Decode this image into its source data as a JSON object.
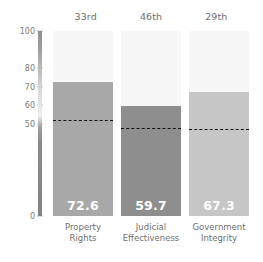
{
  "chart_data": {
    "type": "bar",
    "title": "",
    "subtitle": "",
    "xlabel": "",
    "ylabel": "",
    "ylim": [
      0,
      100
    ],
    "grid": false,
    "legend": "none",
    "categories": [
      "Property Rights",
      "Judicial Effectiveness",
      "Government Integrity"
    ],
    "category_lines": [
      [
        "Property",
        "Rights"
      ],
      [
        "Judicial",
        "Effectiveness"
      ],
      [
        "Government",
        "Integrity"
      ]
    ],
    "values": [
      72.6,
      59.7,
      67.3
    ],
    "value_labels": [
      "72.6",
      "59.7",
      "67.3"
    ],
    "ranks": [
      "33rd",
      "46th",
      "29th"
    ],
    "reference_values": [
      52.0,
      47.5,
      47.0
    ],
    "bar_colors": [
      "#a8a8a8",
      "#8e8e8e",
      "#c6c6c6"
    ],
    "track_color": "#f7f7f7",
    "reference_line_color": "#111111",
    "value_label_color": "#ffffff",
    "axis_ticks": [
      {
        "value": 100,
        "label": "100"
      },
      {
        "value": 80,
        "label": "80"
      },
      {
        "value": 70,
        "label": "70"
      },
      {
        "value": 60,
        "label": "60"
      },
      {
        "value": 50,
        "label": "50"
      },
      {
        "value": 0,
        "label": "0"
      }
    ]
  }
}
